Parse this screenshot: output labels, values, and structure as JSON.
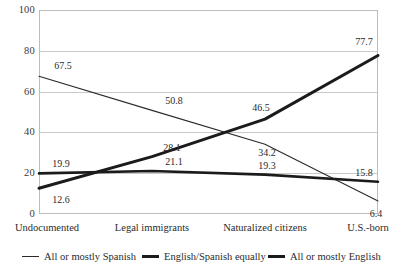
{
  "chart_data": {
    "type": "line",
    "title": "",
    "xlabel": "",
    "ylabel": "",
    "categories": [
      "Undocumented",
      "Legal immigrants",
      "Naturalized citizens",
      "U.S.-born"
    ],
    "ylim": [
      0,
      100
    ],
    "yticks": [
      0,
      20,
      40,
      60,
      80,
      100
    ],
    "ytick_labels": [
      "0",
      "20",
      "40",
      "60",
      "80",
      "100"
    ],
    "grid": true,
    "legend_position": "bottom",
    "series": [
      {
        "name": "All or mostly Spanish",
        "line_weight": "thin",
        "color": "#2b2b2b",
        "values": [
          67.5,
          50.8,
          34.2,
          6.4
        ],
        "value_labels": [
          "67.5",
          "50.8",
          "34.2",
          "6.4"
        ]
      },
      {
        "name": "English/Spanish equally",
        "line_weight": "thick",
        "color": "#1b1b1b",
        "values": [
          12.6,
          28.1,
          46.5,
          77.7
        ],
        "value_labels": [
          "12.6",
          "28.1",
          "46.5",
          "77.7"
        ]
      },
      {
        "name": "All or mostly English",
        "line_weight": "medium",
        "color": "#1b1b1b",
        "values": [
          19.9,
          21.1,
          19.3,
          15.8
        ],
        "value_labels": [
          "19.9",
          "21.1",
          "19.3",
          "15.8"
        ]
      }
    ]
  },
  "legend": {
    "items": [
      {
        "label": "All or mostly Spanish"
      },
      {
        "label": "English/Spanish equally"
      },
      {
        "label": "All or mostly English"
      }
    ]
  }
}
